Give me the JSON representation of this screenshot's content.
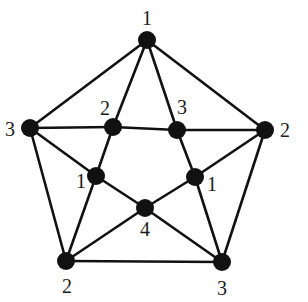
{
  "diagram": {
    "type": "graph",
    "nodes": [
      {
        "id": "top",
        "x": 147,
        "y": 40,
        "label": "1",
        "lx": 147,
        "ly": 18
      },
      {
        "id": "left",
        "x": 30,
        "y": 128,
        "label": "3",
        "lx": 10,
        "ly": 129
      },
      {
        "id": "right",
        "x": 265,
        "y": 130,
        "label": "2",
        "lx": 285,
        "ly": 130
      },
      {
        "id": "iul",
        "x": 113,
        "y": 127,
        "label": "2",
        "lx": 105,
        "ly": 108
      },
      {
        "id": "iur",
        "x": 177,
        "y": 130,
        "label": "3",
        "lx": 182,
        "ly": 107
      },
      {
        "id": "ill",
        "x": 96,
        "y": 176,
        "label": "1",
        "lx": 81,
        "ly": 181
      },
      {
        "id": "ilr",
        "x": 195,
        "y": 177,
        "label": "1",
        "lx": 212,
        "ly": 184
      },
      {
        "id": "center",
        "x": 145,
        "y": 208,
        "label": "4",
        "lx": 145,
        "ly": 229
      },
      {
        "id": "bl",
        "x": 66,
        "y": 261,
        "label": "2",
        "lx": 67,
        "ly": 286
      },
      {
        "id": "br",
        "x": 222,
        "y": 262,
        "label": "3",
        "lx": 222,
        "ly": 288
      }
    ],
    "edges": [
      [
        "top",
        "left"
      ],
      [
        "top",
        "right"
      ],
      [
        "left",
        "bl"
      ],
      [
        "right",
        "br"
      ],
      [
        "bl",
        "br"
      ],
      [
        "top",
        "iul"
      ],
      [
        "top",
        "iur"
      ],
      [
        "left",
        "iul"
      ],
      [
        "iul",
        "iur"
      ],
      [
        "iur",
        "right"
      ],
      [
        "left",
        "ill"
      ],
      [
        "right",
        "ilr"
      ],
      [
        "iul",
        "ill"
      ],
      [
        "iur",
        "ilr"
      ],
      [
        "ill",
        "center"
      ],
      [
        "ilr",
        "center"
      ],
      [
        "bl",
        "ill"
      ],
      [
        "bl",
        "center"
      ],
      [
        "br",
        "ilr"
      ],
      [
        "br",
        "center"
      ]
    ],
    "node_radius": 9,
    "colors": {
      "stroke": "#111111",
      "background": "#ffffff"
    }
  }
}
